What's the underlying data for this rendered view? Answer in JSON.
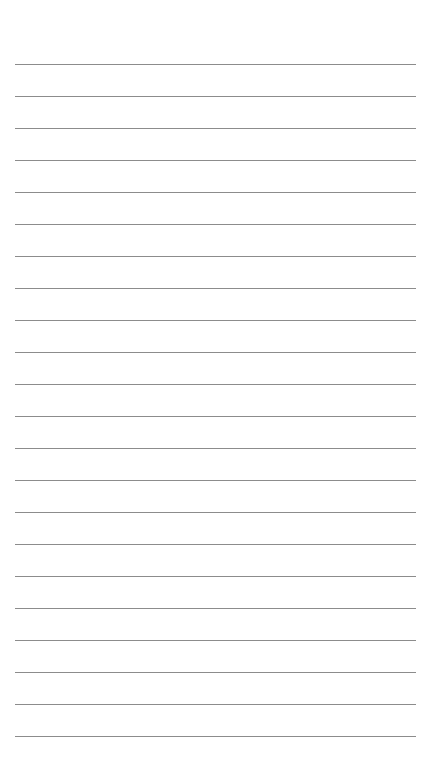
{
  "page": {
    "type": "lined-paper",
    "background_color": "#ffffff",
    "line_color": "#8c8c8c",
    "line_count": 22,
    "first_line_y": 64,
    "line_spacing": 32,
    "line_left": 15,
    "line_right": 416
  }
}
